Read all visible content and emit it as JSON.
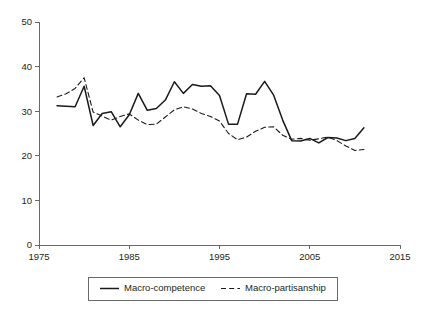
{
  "chart_data": {
    "type": "line",
    "title": "",
    "subtitle": "",
    "xlabel": "",
    "ylabel": "",
    "xlim": [
      1975,
      2015
    ],
    "ylim": [
      0,
      50
    ],
    "grid": false,
    "legend_position": "bottom",
    "x_ticks": [
      1975,
      1985,
      1995,
      2005,
      2015
    ],
    "y_ticks": [
      0,
      10,
      20,
      30,
      40,
      50
    ],
    "x": [
      1977,
      1978,
      1979,
      1980,
      1981,
      1982,
      1983,
      1984,
      1985,
      1986,
      1987,
      1988,
      1989,
      1990,
      1991,
      1992,
      1993,
      1994,
      1995,
      1996,
      1997,
      1998,
      1999,
      2000,
      2001,
      2002,
      2003,
      2004,
      2005,
      2006,
      2007,
      2008,
      2009,
      2010,
      2011
    ],
    "series": [
      {
        "name": "Macro-competence",
        "style": "solid",
        "color": "#1a1a1a",
        "values": [
          31.2,
          31.1,
          31.0,
          35.6,
          26.8,
          29.5,
          29.9,
          26.5,
          29.2,
          34.0,
          30.2,
          30.6,
          32.5,
          36.6,
          34.0,
          36.0,
          35.6,
          35.7,
          33.5,
          27.1,
          27.1,
          33.9,
          33.8,
          36.7,
          33.6,
          28.0,
          23.4,
          23.3,
          23.9,
          22.9,
          24.1,
          24.0,
          23.4,
          23.9,
          26.3
        ]
      },
      {
        "name": "Macro-partisanship",
        "style": "dashed",
        "color": "#1a1a1a",
        "values": [
          33.2,
          33.9,
          35.1,
          37.5,
          29.8,
          28.9,
          28.0,
          28.8,
          29.4,
          28.0,
          27.0,
          27.1,
          28.7,
          30.3,
          31.0,
          30.5,
          29.5,
          28.8,
          27.8,
          25.0,
          23.6,
          24.2,
          25.5,
          26.4,
          26.5,
          24.6,
          23.7,
          23.9,
          23.5,
          23.8,
          24.2,
          23.4,
          22.2,
          21.2,
          21.4
        ]
      }
    ],
    "legend": [
      {
        "label": "Macro-competence",
        "style": "solid"
      },
      {
        "label": "Macro-partisanship",
        "style": "dashed"
      }
    ],
    "axis_color": "#58595b",
    "line_color": "#1a1a1a"
  }
}
